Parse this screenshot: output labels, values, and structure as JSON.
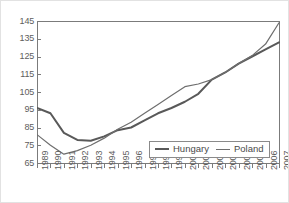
{
  "chart_data": {
    "type": "line",
    "title": "",
    "subtitle": "",
    "xlabel": "",
    "ylabel": "",
    "grid": false,
    "legend_position": "inside-bottom-right",
    "x": [
      1989,
      1990,
      1991,
      1992,
      1993,
      1994,
      1995,
      1996,
      1997,
      1998,
      1999,
      2000,
      2001,
      2002,
      2003,
      2004,
      2005,
      2006,
      2007
    ],
    "categories": [
      "1989",
      "1990",
      "1991",
      "1992",
      "1993",
      "1994",
      "1995",
      "1996",
      "1997",
      "1998",
      "1999",
      "2000",
      "2001",
      "2002",
      "2003",
      "2004",
      "2005",
      "2006",
      "2007"
    ],
    "xlim": [
      1989,
      2007
    ],
    "ylim": [
      65,
      145
    ],
    "yticks": [
      65,
      75,
      85,
      95,
      105,
      115,
      125,
      135,
      145
    ],
    "ytick_labels": [
      "65",
      "75",
      "85",
      "95",
      "105",
      "115",
      "125",
      "135",
      "145"
    ],
    "series": [
      {
        "name": "Hungary",
        "color": "#595959",
        "line_width": 2,
        "values": [
          96,
          93,
          82,
          78,
          77.5,
          80,
          83.5,
          85,
          89,
          93,
          96,
          99.5,
          104,
          112,
          116,
          121,
          125,
          129,
          133
        ]
      },
      {
        "name": "Poland",
        "color": "#6e6e6e",
        "line_width": 1.2,
        "values": [
          81,
          75,
          70,
          72,
          75,
          79,
          84,
          88,
          93,
          98,
          103,
          108,
          109.5,
          112,
          116,
          121,
          125.5,
          132,
          144
        ]
      }
    ]
  },
  "legend": {
    "entries": [
      {
        "label": "Hungary"
      },
      {
        "label": "Poland"
      }
    ]
  },
  "colors": {
    "hungary_line": "#595959",
    "poland_line": "#6e6e6e",
    "axis": "#7b7b7b",
    "tick_text": "#5d5d5d",
    "outer_border": "#e2e2e2",
    "plot_background": "#ffffff"
  }
}
